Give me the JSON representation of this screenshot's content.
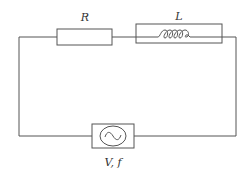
{
  "diagram": {
    "type": "circuit",
    "components": {
      "resistor": {
        "label": "R"
      },
      "inductor": {
        "label": "L"
      },
      "source": {
        "label": "V, f",
        "symbol": "ac-sine"
      }
    },
    "colors": {
      "line": "#555555",
      "background": "#ffffff",
      "text": "#333333"
    }
  }
}
